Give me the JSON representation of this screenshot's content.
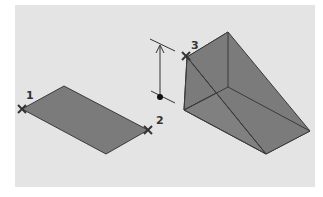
{
  "diagram": {
    "colors": {
      "background": "#e4e4e4",
      "face_fill": "#7b7b7b",
      "edge": "#3a3a3a",
      "marker": "#333333"
    },
    "points": [
      {
        "label": "1",
        "role": "rectangle corner",
        "marker": "x-marker"
      },
      {
        "label": "2",
        "role": "opposite rectangle corner",
        "marker": "x-marker"
      },
      {
        "label": "3",
        "role": "height point",
        "marker": "x-marker"
      }
    ],
    "shapes": [
      {
        "name": "base-rectangle",
        "type": "parallelogram (isometric rectangle)"
      },
      {
        "name": "wedge-solid",
        "type": "3D wedge"
      },
      {
        "name": "height-dimension",
        "type": "vertical arrow with base dot"
      }
    ]
  }
}
